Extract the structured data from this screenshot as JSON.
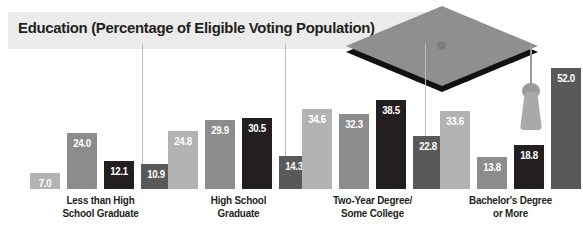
{
  "title": "Education (Percentage of Eligible Voting Population)",
  "graphic": {
    "name": "graduation-cap",
    "parts": [
      "mortarboard",
      "cap-base",
      "tassel"
    ]
  },
  "colors": {
    "series_light_gray": "#b3b3b3",
    "series_medium_gray": "#8c8c8c",
    "series_black": "#231f20",
    "series_dark_gray": "#595959",
    "title_band": "#ebebeb",
    "title_text": "#231f20",
    "divider": "#bdbdbd",
    "value_label": "#ffffff"
  },
  "chart_data": {
    "type": "bar",
    "title": "Education (Percentage of Eligible Voting Population)",
    "xlabel": "",
    "ylabel": "",
    "ylim": [
      0,
      55
    ],
    "grid": false,
    "legend": "none",
    "categories": [
      "Less than High School Graduate",
      "High School Graduate",
      "Two-Year Degree/ Some College",
      "Bachelor's Degree or More"
    ],
    "category_lines": [
      [
        "Less than High",
        "School Graduate"
      ],
      [
        "High School",
        "Graduate"
      ],
      [
        "Two-Year Degree/",
        "Some College"
      ],
      [
        "Bachelor's Degree",
        "or More"
      ]
    ],
    "series": [
      {
        "name": "Series 1",
        "color": "#b3b3b3",
        "values": [
          7.0,
          24.8,
          34.6,
          33.6
        ]
      },
      {
        "name": "Series 2",
        "color": "#8c8c8c",
        "values": [
          24.0,
          29.9,
          32.3,
          13.8
        ]
      },
      {
        "name": "Series 3",
        "color": "#231f20",
        "values": [
          12.1,
          30.5,
          38.5,
          18.8
        ]
      },
      {
        "name": "Series 4",
        "color": "#595959",
        "values": [
          10.9,
          14.3,
          22.8,
          52.0
        ]
      }
    ],
    "value_labels": [
      [
        "7.0",
        "24.0",
        "12.1",
        "10.9"
      ],
      [
        "24.8",
        "29.9",
        "30.5",
        "14.3"
      ],
      [
        "34.6",
        "32.3",
        "38.5",
        "22.8"
      ],
      [
        "33.6",
        "13.8",
        "18.8",
        "52.0"
      ]
    ]
  }
}
